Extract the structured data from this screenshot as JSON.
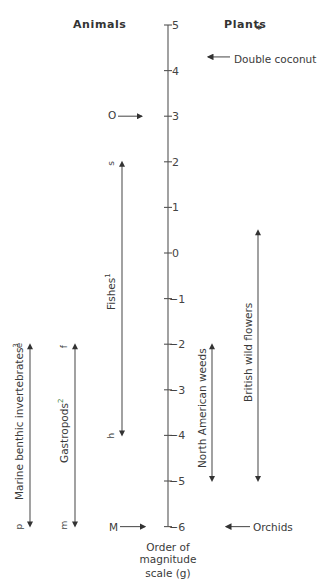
{
  "headers": {
    "animals": "Animals",
    "plants": "Plants",
    "plants_mark": "*"
  },
  "axis": {
    "ticks": [
      "5",
      "4",
      "3",
      "2",
      "1",
      "0",
      "-1",
      "-2",
      "-3",
      "-4",
      "-5",
      "-6"
    ],
    "title_lines": [
      "Order of",
      "magnitude",
      "scale  (g)"
    ]
  },
  "animals": {
    "point_top": {
      "label": "O",
      "value": 3
    },
    "point_bottom": {
      "label": "M",
      "value": -6
    },
    "ranges": [
      {
        "name": "Marine benthic invertebrates",
        "sup": "3",
        "top_letter": "e",
        "bottom_letter": "p",
        "from": -2,
        "to": -6
      },
      {
        "name": "Gastropods",
        "sup": "2",
        "top_letter": "f",
        "bottom_letter": "m",
        "from": -2,
        "to": -6
      },
      {
        "name": "Fishes",
        "sup": "1",
        "top_letter": "s",
        "bottom_letter": "h",
        "from": 2,
        "to": -4
      }
    ]
  },
  "plants": {
    "point_top": {
      "label": "Double coconut",
      "value": 4.3
    },
    "point_bottom": {
      "label": "Orchids",
      "value": -6
    },
    "ranges": [
      {
        "name": "North American weeds",
        "from": -2,
        "to": -5
      },
      {
        "name": "British wild flowers",
        "from": 0.5,
        "to": -5
      }
    ]
  }
}
